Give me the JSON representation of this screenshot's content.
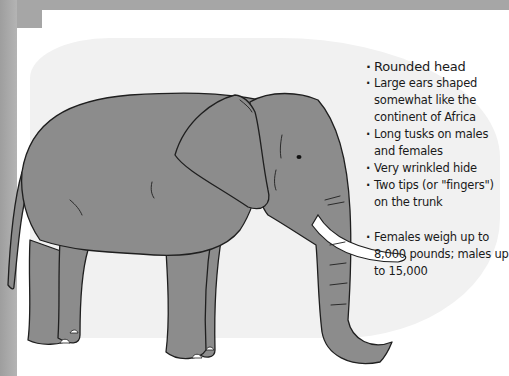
{
  "illustration": {
    "subject": "elephant",
    "colors": {
      "background_frame": "#a9a9a9",
      "paper": "#ffffff",
      "highlight_blob": "#f1f1f1",
      "body_fill": "#8c8c8c",
      "outline": "#1f1f1f",
      "tusk": "#ffffff"
    }
  },
  "notes": [
    {
      "lines": [
        "Rounded head"
      ]
    },
    {
      "lines": [
        "Large ears shaped",
        "somewhat like the",
        "continent of Africa"
      ]
    },
    {
      "lines": [
        "Long tusks on males",
        "and females"
      ]
    },
    {
      "lines": [
        "Very wrinkled hide"
      ]
    },
    {
      "lines": [
        "Two tips (or \"fingers\")",
        "on the trunk"
      ]
    },
    {
      "lines": [
        "Females weigh up to",
        "8,000 pounds; males up",
        "to 15,000"
      ]
    }
  ]
}
